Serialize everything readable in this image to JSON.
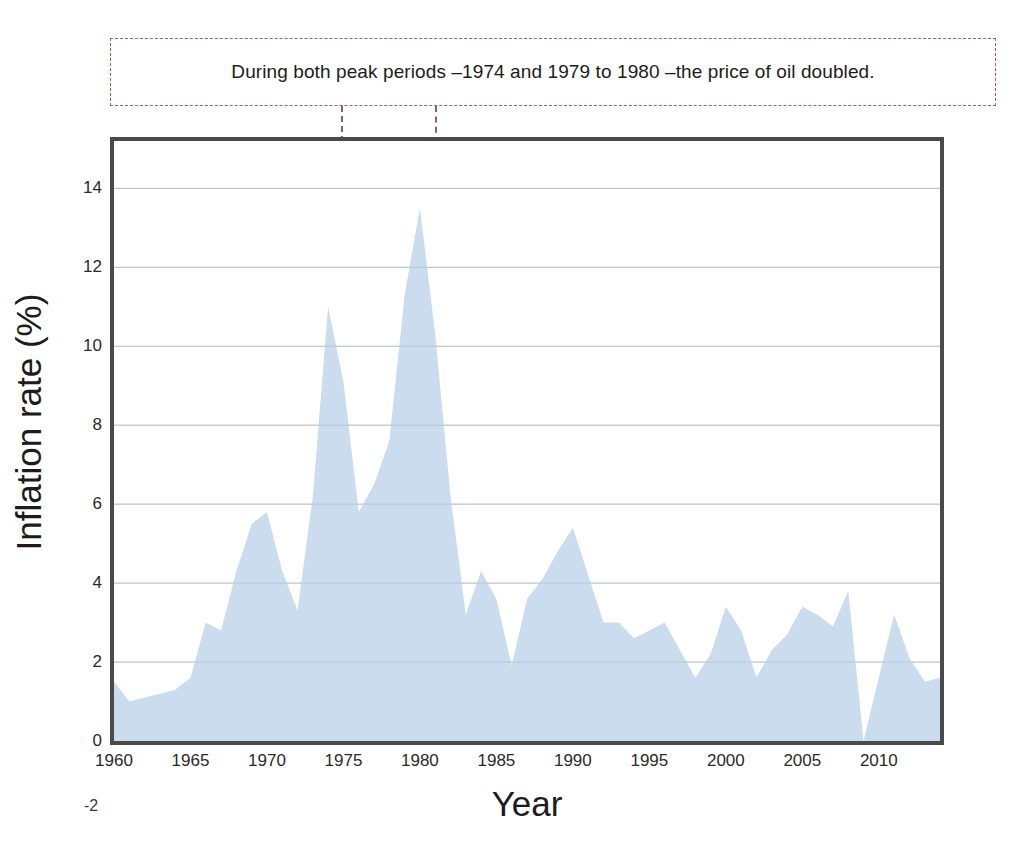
{
  "annotation": {
    "text": "During both peak periods –1974 and 1979 to 1980 –the price of oil doubled.",
    "box_border_color": "#b05a5a",
    "markers": [
      {
        "name": "marker-1974",
        "year": 1974,
        "value": 11.0,
        "label": ""
      },
      {
        "name": "marker-1980",
        "year": 1980,
        "value": 13.5,
        "label": ""
      }
    ],
    "marker_color": "#8b4543"
  },
  "axes": {
    "y_title": "Inflation rate (%)",
    "x_title": "Year",
    "y_ticks": [
      "0",
      "2",
      "4",
      "6",
      "8",
      "10",
      "12",
      "14"
    ],
    "y_tick_values": [
      0,
      2,
      4,
      6,
      8,
      10,
      12,
      14
    ],
    "x_ticks": [
      "1960",
      "1965",
      "1970",
      "1975",
      "1980",
      "1985",
      "1990",
      "1995",
      "2000",
      "2005",
      "2010"
    ],
    "x_tick_values": [
      1960,
      1965,
      1970,
      1975,
      1980,
      1985,
      1990,
      1995,
      2000,
      2005,
      2010
    ],
    "stray_label": "-2"
  },
  "style": {
    "area_fill": "#cadced",
    "area_line": "#bcd2e6",
    "frame_color": "#4a4a4a",
    "gridline_color": "#9aa4ad",
    "background": "#ffffff"
  },
  "chart_data": {
    "type": "area",
    "title": "",
    "subtitle": "",
    "xlabel": "Year",
    "ylabel": "Inflation rate (%)",
    "xlim": [
      1960,
      2014
    ],
    "ylim": [
      0,
      15.2
    ],
    "grid": true,
    "legend": false,
    "annotations": [
      {
        "text": "During both peak periods –1974 and 1979 to 1980 –the price of oil doubled.",
        "points_to": [
          1974,
          1980
        ]
      }
    ],
    "series": [
      {
        "name": "Inflation rate",
        "x": [
          1960,
          1961,
          1962,
          1963,
          1964,
          1965,
          1966,
          1967,
          1968,
          1969,
          1970,
          1971,
          1972,
          1973,
          1974,
          1975,
          1976,
          1977,
          1978,
          1979,
          1980,
          1981,
          1982,
          1983,
          1984,
          1985,
          1986,
          1987,
          1988,
          1989,
          1990,
          1991,
          1992,
          1993,
          1994,
          1995,
          1996,
          1997,
          1998,
          1999,
          2000,
          2001,
          2002,
          2003,
          2004,
          2005,
          2006,
          2007,
          2008,
          2009,
          2010,
          2011,
          2012,
          2013,
          2014
        ],
        "values": [
          1.5,
          1.0,
          1.1,
          1.2,
          1.3,
          1.6,
          3.0,
          2.8,
          4.3,
          5.5,
          5.8,
          4.3,
          3.3,
          6.2,
          11.0,
          9.1,
          5.8,
          6.5,
          7.6,
          11.3,
          13.5,
          10.3,
          6.2,
          3.2,
          4.3,
          3.6,
          1.9,
          3.6,
          4.1,
          4.8,
          5.4,
          4.2,
          3.0,
          3.0,
          2.6,
          2.8,
          3.0,
          2.3,
          1.6,
          2.2,
          3.4,
          2.8,
          1.6,
          2.3,
          2.7,
          3.4,
          3.2,
          2.9,
          3.8,
          -0.4,
          1.6,
          3.2,
          2.1,
          1.5,
          1.6
        ]
      }
    ]
  }
}
